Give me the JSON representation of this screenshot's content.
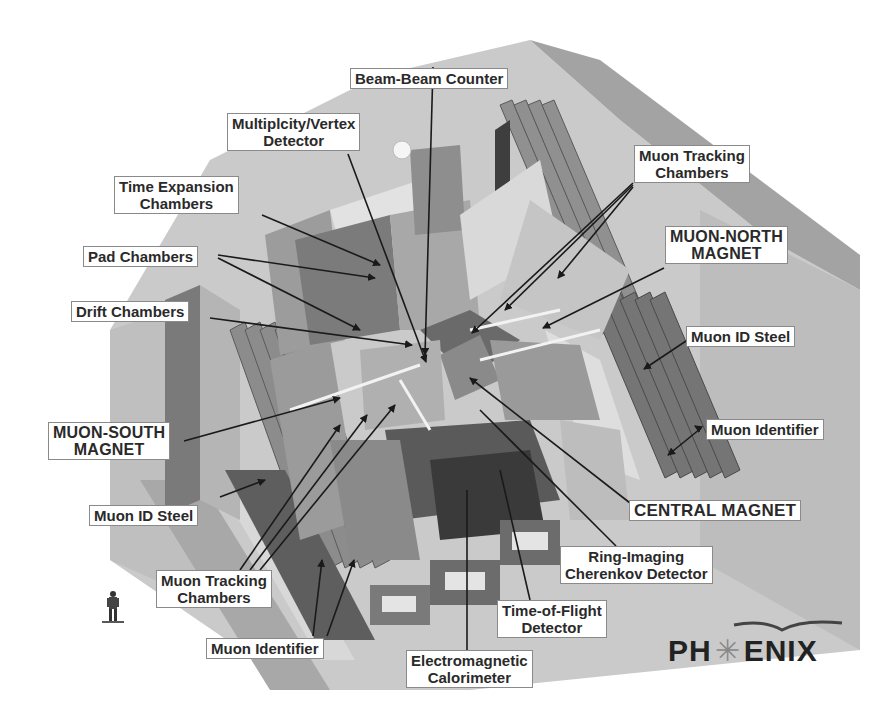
{
  "diagram": {
    "type": "labeled cutaway illustration",
    "logo": {
      "left": "PH",
      "right": "ENIX",
      "full": "PHENIX"
    },
    "labels": {
      "beam_beam_counter": [
        "Beam-Beam Counter"
      ],
      "multiplicity_vertex": [
        "Multiplcity/Vertex",
        "Detector"
      ],
      "time_expansion": [
        "Time Expansion",
        "Chambers"
      ],
      "pad_chambers": [
        "Pad Chambers"
      ],
      "drift_chambers": [
        "Drift Chambers"
      ],
      "muon_south_magnet": [
        "MUON-SOUTH",
        "MAGNET"
      ],
      "muon_id_steel_left": [
        "Muon ID Steel"
      ],
      "muon_tracking_left": [
        "Muon Tracking",
        "Chambers"
      ],
      "muon_identifier_left": [
        "Muon Identifier"
      ],
      "em_calorimeter": [
        "Electromagnetic",
        "Calorimeter"
      ],
      "time_of_flight": [
        "Time-of-Flight",
        "Detector"
      ],
      "rich": [
        "Ring-Imaging",
        "Cherenkov Detector"
      ],
      "central_magnet": [
        "CENTRAL MAGNET"
      ],
      "muon_identifier_right": [
        "Muon Identifier"
      ],
      "muon_id_steel_right": [
        "Muon ID Steel"
      ],
      "muon_north_magnet": [
        "MUON-NORTH",
        "MAGNET"
      ],
      "muon_tracking_right": [
        "Muon Tracking",
        "Chambers"
      ]
    },
    "colors": {
      "background": "#ffffff",
      "slab": "#c8c8c8",
      "slab_dark": "#9a9a9a",
      "component_dark": "#6e6e6e",
      "component_mid": "#a5a5a5",
      "component_light": "#dedede",
      "leader": "#1a1a1a",
      "label_border": "#8a8a8a",
      "label_text": "#2a2a2a"
    }
  }
}
